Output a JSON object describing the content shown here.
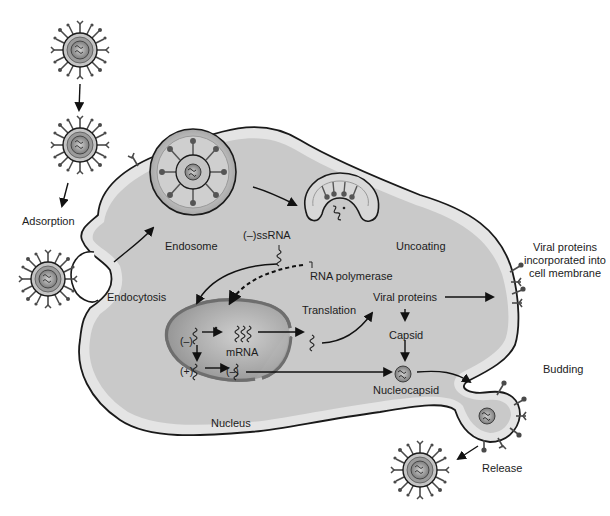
{
  "diagram": {
    "type": "viral replication cycle (negative-sense ssRNA enveloped virus)",
    "colors": {
      "background": "#ffffff",
      "cytoplasm": "#c9c9c9",
      "membrane": "#e2e2e2",
      "outline": "#1a1a1a",
      "nucleus": "#9a9a9a",
      "nucleus_light": "#bdbdbd",
      "virion_core": "#8f8f8f",
      "virion_ring": "#b8b8b8",
      "spike": "#555555"
    },
    "labels": {
      "adsorption": "Adsorption",
      "endocytosis": "Endocytosis",
      "endosome": "Endosome",
      "neg_ssrna": "(–)ssRNA",
      "uncoating": "Uncoating",
      "rna_polymerase": "RNA polymerase",
      "translation": "Translation",
      "viral_proteins": "Viral proteins",
      "viral_proteins_membrane": "Viral proteins incorporated into cell membrane",
      "capsid": "Capsid",
      "mrna": "mRNA",
      "neg_strand_1": "(–)",
      "pos_strand": "(+)",
      "neg_strand_2": "(–)",
      "nucleocapsid": "Nucleocapsid",
      "nucleus": "Nucleus",
      "budding": "Budding",
      "release": "Release"
    },
    "steps": [
      "Adsorption",
      "Endocytosis",
      "Endosome",
      "Uncoating",
      "(–)ssRNA",
      "RNA polymerase",
      "mRNA",
      "Translation",
      "Viral proteins",
      "Capsid",
      "Nucleocapsid",
      "Budding",
      "Release"
    ]
  }
}
